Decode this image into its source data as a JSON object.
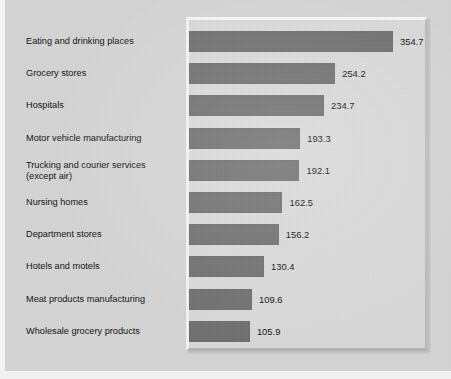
{
  "chart_data": {
    "type": "bar",
    "orientation": "horizontal",
    "title": "",
    "subtitle": "",
    "xlabel": "",
    "ylabel": "",
    "grid": false,
    "legend": null,
    "legend_position": "none",
    "axis_visible": false,
    "tick_labels": [],
    "xlim": [
      0,
      354.7
    ],
    "value_label_format": "one-decimal",
    "bar_color": "#6f6f6f",
    "panel_color": "#d9d9d9",
    "background_color": "#d4d4d4",
    "categories": [
      "Eating and drinking places",
      "Grocery stores",
      "Hospitals",
      "Motor vehicle manufacturing",
      "Trucking and courier services\n(except air)",
      "Nursing homes",
      "Department stores",
      "Hotels and motels",
      "Meat products manufacturing",
      "Wholesale grocery products"
    ],
    "values": [
      354.7,
      254.2,
      234.7,
      193.3,
      192.1,
      162.5,
      156.2,
      130.4,
      109.6,
      105.9
    ],
    "value_labels": [
      "354.7",
      "254.2",
      "234.7",
      "193.3",
      "192.1",
      "162.5",
      "156.2",
      "130.4",
      "109.6",
      "105.9"
    ],
    "bars": [
      {
        "category": "Eating and drinking places",
        "value": 354.7,
        "label": "354.7"
      },
      {
        "category": "Grocery stores",
        "value": 254.2,
        "label": "254.2"
      },
      {
        "category": "Hospitals",
        "value": 234.7,
        "label": "234.7"
      },
      {
        "category": "Motor vehicle manufacturing",
        "value": 193.3,
        "label": "193.3"
      },
      {
        "category": "Trucking and courier services\n(except air)",
        "value": 192.1,
        "label": "192.1"
      },
      {
        "category": "Nursing homes",
        "value": 162.5,
        "label": "162.5"
      },
      {
        "category": "Department stores",
        "value": 156.2,
        "label": "156.2"
      },
      {
        "category": "Hotels and motels",
        "value": 130.4,
        "label": "130.4"
      },
      {
        "category": "Meat products manufacturing",
        "value": 109.6,
        "label": "109.6"
      },
      {
        "category": "Wholesale grocery products",
        "value": 105.9,
        "label": "105.9"
      }
    ]
  }
}
